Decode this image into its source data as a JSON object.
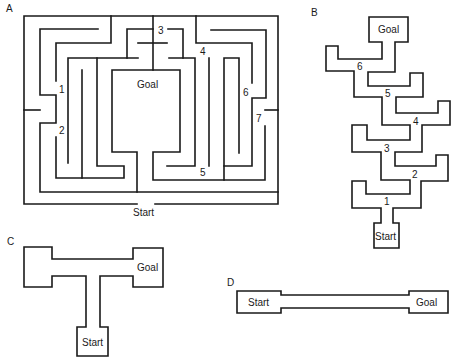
{
  "panels": {
    "A": {
      "letter": "A",
      "start_label": "Start",
      "goal_label": "Goal",
      "choice_points": [
        "1",
        "2",
        "3",
        "4",
        "5",
        "6",
        "7"
      ]
    },
    "B": {
      "letter": "B",
      "start_label": "Start",
      "goal_label": "Goal",
      "choice_points": [
        "1",
        "2",
        "3",
        "4",
        "5",
        "6"
      ]
    },
    "C": {
      "letter": "C",
      "start_label": "Start",
      "goal_label": "Goal"
    },
    "D": {
      "letter": "D",
      "start_label": "Start",
      "goal_label": "Goal"
    }
  },
  "colors": {
    "line": "#1a1a1a",
    "background": "#ffffff"
  }
}
